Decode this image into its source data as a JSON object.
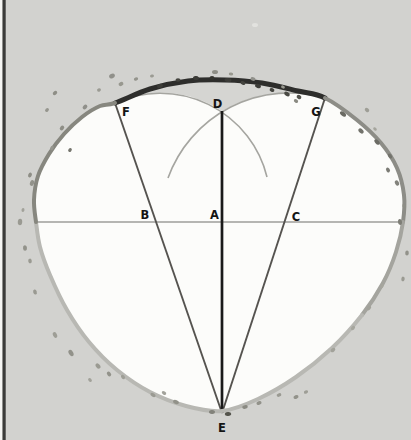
{
  "diagram": {
    "colors": {
      "background": "#d2d2cf",
      "interior": "#fcfcfa",
      "wedge": "#d5d5d2",
      "label_text": "#141414",
      "edge_dark_arc": "#2e2e2c",
      "edge_right_upper": "#8d8d87",
      "edge_lower_right": "#a4a49e",
      "edge_lower": "#b8b8b3",
      "edge_left_upper": "#87877f",
      "construction_arc": "#a5a5a0",
      "horizontal_line": "#9e9e9a",
      "chord_line": "#55534f",
      "axis_line": "#1a1a1a",
      "frame_strip": "#f5f5f3",
      "frame_bar": "#3b3b39"
    },
    "frame": {
      "strip_x": 0,
      "strip_w": 2.5,
      "bar_x": 2.5,
      "bar_w": 3.2
    },
    "outline": {
      "points": [
        [
          115,
          103
        ],
        [
          150,
          89
        ],
        [
          188,
          81
        ],
        [
          225,
          80
        ],
        [
          262,
          83
        ],
        [
          298,
          91
        ],
        [
          325,
          98
        ],
        [
          357,
          120
        ],
        [
          381,
          143
        ],
        [
          397,
          168
        ],
        [
          404,
          195
        ],
        [
          403,
          222
        ],
        [
          396,
          252
        ],
        [
          383,
          283
        ],
        [
          362,
          315
        ],
        [
          332,
          348
        ],
        [
          296,
          377
        ],
        [
          258,
          399
        ],
        [
          222,
          411
        ],
        [
          186,
          406
        ],
        [
          150,
          392
        ],
        [
          117,
          370
        ],
        [
          89,
          342
        ],
        [
          67,
          310
        ],
        [
          50,
          275
        ],
        [
          40,
          247
        ],
        [
          36,
          222
        ],
        [
          34,
          200
        ],
        [
          38,
          176
        ],
        [
          49,
          154
        ],
        [
          64,
          134
        ],
        [
          82,
          117
        ],
        [
          100,
          106
        ]
      ],
      "segments": [
        {
          "name": "arc-F-G-dark",
          "from": 0,
          "to": 6,
          "colorKey": "edge_dark_arc",
          "width": 5
        },
        {
          "name": "edge-right-upper",
          "from": 6,
          "to": 11,
          "colorKey": "edge_right_upper",
          "width": 4
        },
        {
          "name": "edge-right-lower",
          "from": 11,
          "to": 14,
          "colorKey": "edge_lower_right",
          "width": 4
        },
        {
          "name": "edge-bottom",
          "from": 14,
          "to": 26,
          "colorKey": "edge_lower",
          "width": 4
        },
        {
          "name": "edge-left-upper",
          "from": 26,
          "to": 33,
          "colorKey": "edge_left_upper",
          "width": 4
        }
      ]
    },
    "wedge": {
      "apex": [
        222,
        111
      ],
      "right_r": 129,
      "left_r": 110
    },
    "construction_arcs": [
      {
        "name": "compass-arc-left",
        "from": [
          115,
          103
        ],
        "to": [
          267,
          177
        ],
        "r": 110,
        "sweep": 1,
        "width": 1.6
      },
      {
        "name": "compass-arc-right",
        "from": [
          325,
          98
        ],
        "to": [
          168,
          178
        ],
        "r": 129,
        "sweep": 0,
        "width": 1.6
      }
    ],
    "lines": [
      {
        "name": "diameter-horizontal",
        "x1": 36,
        "y1": 222,
        "x2": 402,
        "y2": 222,
        "colorKey": "horizontal_line",
        "width": 1.7
      },
      {
        "name": "chord-F-E",
        "x1": 115,
        "y1": 103,
        "x2": 222,
        "y2": 413,
        "colorKey": "chord_line",
        "width": 1.9
      },
      {
        "name": "chord-G-E",
        "x1": 325,
        "y1": 98,
        "x2": 222,
        "y2": 413,
        "colorKey": "chord_line",
        "width": 1.9
      },
      {
        "name": "axis-D-E",
        "x1": 222,
        "y1": 111,
        "x2": 222,
        "y2": 413,
        "colorKey": "axis_line",
        "width": 2.7
      }
    ],
    "labels": [
      {
        "text": "F",
        "x": 126,
        "y": 116
      },
      {
        "text": "D",
        "x": 217.5,
        "y": 108
      },
      {
        "text": "G",
        "x": 316,
        "y": 115.5
      },
      {
        "text": "B",
        "x": 145,
        "y": 218.5
      },
      {
        "text": "A",
        "x": 214.5,
        "y": 218.5
      },
      {
        "text": "C",
        "x": 296,
        "y": 220.5
      },
      {
        "text": "E",
        "x": 222,
        "y": 431.5
      }
    ],
    "label_font_size": 11.5,
    "speckles": [
      [
        160,
        86,
        3,
        2,
        -20,
        "#3c3c38"
      ],
      [
        178,
        80,
        2.5,
        1.8,
        0,
        "#44443f"
      ],
      [
        196,
        78,
        3,
        2,
        10,
        "#3c3c38"
      ],
      [
        212,
        78,
        2.5,
        2,
        0,
        "#34342f"
      ],
      [
        228,
        80,
        3.5,
        2,
        8,
        "#3c3c38"
      ],
      [
        243,
        83,
        2.5,
        1.8,
        15,
        "#44443f"
      ],
      [
        258,
        86,
        3,
        2,
        20,
        "#3c3c38"
      ],
      [
        272,
        90,
        2.5,
        1.8,
        25,
        "#44443f"
      ],
      [
        287,
        94,
        3,
        2,
        30,
        "#4a4a44"
      ],
      [
        299,
        97,
        2.5,
        2,
        32,
        "#54544e"
      ],
      [
        112,
        76,
        3,
        2.2,
        -30,
        "#90908a"
      ],
      [
        121,
        84,
        2.5,
        2,
        -25,
        "#98988f"
      ],
      [
        99,
        90,
        2,
        1.6,
        -30,
        "#9b9b93"
      ],
      [
        136,
        79,
        2.2,
        1.6,
        -20,
        "#94948c"
      ],
      [
        152,
        76,
        2,
        1.5,
        -15,
        "#9b9b93"
      ],
      [
        215,
        72,
        3,
        2,
        0,
        "#8e8e86"
      ],
      [
        231,
        74,
        2.2,
        1.6,
        5,
        "#98988f"
      ],
      [
        253,
        79,
        2.5,
        1.8,
        12,
        "#90908a"
      ],
      [
        283,
        87,
        2,
        1.5,
        25,
        "#98988f"
      ],
      [
        296,
        101,
        2.3,
        1.7,
        30,
        "#8a8a82"
      ],
      [
        85,
        107,
        2.6,
        2,
        -40,
        "#90908a"
      ],
      [
        343,
        114,
        3.5,
        2,
        40,
        "#6b6b64"
      ],
      [
        361,
        131,
        3,
        2,
        42,
        "#73736c"
      ],
      [
        377,
        142,
        3.2,
        2,
        48,
        "#6b6b64"
      ],
      [
        390,
        156,
        2.8,
        1.8,
        55,
        "#73736c"
      ],
      [
        388,
        170,
        2.5,
        1.8,
        60,
        "#7b7b74"
      ],
      [
        397,
        183,
        2.8,
        2,
        65,
        "#83837c"
      ],
      [
        367,
        110,
        2.5,
        1.8,
        40,
        "#9e9e96"
      ],
      [
        375,
        129,
        2,
        1.5,
        45,
        "#a5a59d"
      ],
      [
        404,
        206,
        2.2,
        1.6,
        80,
        "#8e8e86"
      ],
      [
        400,
        222,
        3,
        2,
        85,
        "#7e7e76"
      ],
      [
        407,
        253,
        2.6,
        1.8,
        95,
        "#92928a"
      ],
      [
        403,
        279,
        2.4,
        1.7,
        100,
        "#9a9a92"
      ],
      [
        32,
        183,
        3,
        2,
        -70,
        "#92928a"
      ],
      [
        20,
        222,
        3.2,
        2.2,
        -85,
        "#9a9a92"
      ],
      [
        25,
        248,
        2.8,
        2,
        -95,
        "#92928a"
      ],
      [
        30,
        261,
        2.4,
        1.8,
        -100,
        "#9a9a92"
      ],
      [
        35,
        292,
        2.6,
        1.8,
        -105,
        "#9a9a92"
      ],
      [
        23,
        210,
        2,
        1.5,
        -80,
        "#a2a29a"
      ],
      [
        55,
        93,
        2.4,
        1.8,
        -35,
        "#8e8e86"
      ],
      [
        47,
        110,
        2.2,
        1.6,
        -45,
        "#96968e"
      ],
      [
        62,
        128,
        2.6,
        1.9,
        -50,
        "#8e8e86"
      ],
      [
        52,
        148,
        2.3,
        1.7,
        -55,
        "#96968e"
      ],
      [
        30,
        175,
        2.5,
        1.8,
        -65,
        "#8e8e86"
      ],
      [
        70,
        150,
        2.2,
        1.6,
        -55,
        "#76766e"
      ],
      [
        55,
        335,
        3,
        2,
        -115,
        "#9e9e96"
      ],
      [
        71,
        353,
        3.4,
        2.2,
        -120,
        "#92928a"
      ],
      [
        98,
        366,
        3,
        2,
        -128,
        "#9a9a92"
      ],
      [
        109,
        374,
        2.6,
        1.8,
        -130,
        "#92928a"
      ],
      [
        90,
        380,
        2.2,
        1.6,
        -128,
        "#a2a29a"
      ],
      [
        123,
        377,
        2.4,
        1.7,
        -135,
        "#9e9e96"
      ],
      [
        153,
        395,
        2.8,
        1.8,
        -150,
        "#9a9a92"
      ],
      [
        164,
        393,
        2.4,
        1.6,
        -150,
        "#a2a29a"
      ],
      [
        176,
        402,
        3,
        2,
        -155,
        "#92928a"
      ],
      [
        212,
        412,
        3,
        2,
        -175,
        "#82827a"
      ],
      [
        228,
        414,
        3.2,
        2,
        175,
        "#54544c"
      ],
      [
        245,
        407,
        2.8,
        1.8,
        170,
        "#8a8a82"
      ],
      [
        259,
        403,
        2.6,
        1.8,
        165,
        "#92928a"
      ],
      [
        279,
        395,
        2.4,
        1.7,
        160,
        "#9a9a92"
      ],
      [
        296,
        397,
        2.6,
        1.8,
        158,
        "#92928a"
      ],
      [
        306,
        392,
        2.2,
        1.6,
        155,
        "#9e9e96"
      ],
      [
        333,
        350,
        2.6,
        1.8,
        140,
        "#a2a29a"
      ],
      [
        353,
        328,
        2.4,
        1.7,
        135,
        "#a6a69e"
      ],
      [
        369,
        308,
        2.6,
        1.8,
        128,
        "#a2a29a"
      ],
      [
        382,
        286,
        2.2,
        1.6,
        120,
        "#a6a69e"
      ],
      [
        255,
        25,
        3,
        2,
        0,
        "#e2e2df"
      ]
    ]
  }
}
